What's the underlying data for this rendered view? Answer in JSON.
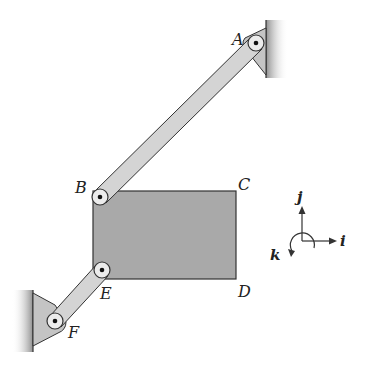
{
  "diagram": {
    "type": "mechanism-linkage",
    "points": {
      "A": {
        "label": "A",
        "x": 256,
        "y": 43
      },
      "B": {
        "label": "B",
        "x": 100,
        "y": 197
      },
      "C": {
        "label": "C",
        "x": 236,
        "y": 190
      },
      "D": {
        "label": "D",
        "x": 236,
        "y": 278
      },
      "E": {
        "label": "E",
        "x": 102,
        "y": 270
      },
      "F": {
        "label": "F",
        "x": 55,
        "y": 321
      }
    },
    "labels": {
      "A": "A",
      "B": "B",
      "C": "C",
      "D": "D",
      "E": "E",
      "F": "F"
    },
    "axes": {
      "i": "i",
      "j": "j",
      "k": "k"
    },
    "colors": {
      "plate": "#a9a9a9",
      "link": "#d4d4d4",
      "support": "#c4c4c4",
      "wall": "#9a9a9a",
      "stroke": "#333333"
    }
  }
}
